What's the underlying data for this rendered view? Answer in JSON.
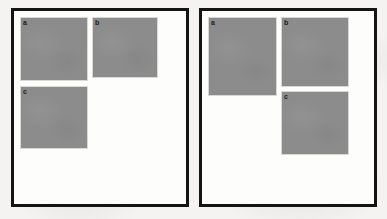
{
  "figure": {
    "background_color": "#f4f3f1",
    "panel_border_color": "#141414",
    "panel_fill_color": "#fdfdfc",
    "box_fill_color": "#8c8c8c",
    "box_border_color": "#d8d8d6",
    "label_color": "#1d1d1d",
    "panels": [
      {
        "name": "left-panel",
        "x": 11,
        "y": 8,
        "width": 178,
        "height": 199,
        "boxes": [
          {
            "label": "a",
            "x": 6,
            "y": 6,
            "width": 68,
            "height": 64
          },
          {
            "label": "b",
            "x": 78,
            "y": 6,
            "width": 66,
            "height": 61
          },
          {
            "label": "c",
            "x": 6,
            "y": 75,
            "width": 68,
            "height": 63
          }
        ]
      },
      {
        "name": "right-panel",
        "x": 199,
        "y": 8,
        "width": 178,
        "height": 199,
        "boxes": [
          {
            "label": "a",
            "x": 6,
            "y": 6,
            "width": 69,
            "height": 79
          },
          {
            "label": "b",
            "x": 79,
            "y": 6,
            "width": 68,
            "height": 70
          },
          {
            "label": "c",
            "x": 79,
            "y": 80,
            "width": 68,
            "height": 64
          }
        ]
      }
    ]
  }
}
